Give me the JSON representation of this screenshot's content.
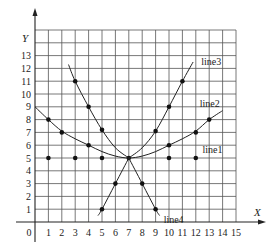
{
  "chart_data": {
    "type": "line",
    "title": "",
    "xlabel": "X",
    "ylabel": "Y",
    "xlim": [
      0,
      15
    ],
    "ylim": [
      0,
      15
    ],
    "grid": true,
    "x_ticks": [
      0,
      1,
      2,
      3,
      4,
      5,
      6,
      7,
      8,
      9,
      10,
      11,
      12,
      13,
      14,
      15
    ],
    "y_ticks": [
      1,
      2,
      3,
      4,
      5,
      6,
      7,
      8,
      9,
      10,
      11,
      12,
      13
    ],
    "origin_label": "0",
    "series": [
      {
        "name": "line1",
        "kind": "points",
        "points": [
          [
            1,
            5
          ],
          [
            3,
            5
          ],
          [
            5,
            5
          ],
          [
            7,
            5
          ],
          [
            10,
            5
          ],
          [
            12,
            5
          ]
        ],
        "label_at": [
          12.5,
          5.6
        ]
      },
      {
        "name": "line2",
        "kind": "curve",
        "curve": [
          [
            0,
            9
          ],
          [
            1,
            8
          ],
          [
            2,
            7.1
          ],
          [
            3,
            6.5
          ],
          [
            4,
            6
          ],
          [
            5,
            5.5
          ],
          [
            6,
            5.15
          ],
          [
            7,
            5
          ],
          [
            8,
            5.15
          ],
          [
            9,
            5.5
          ],
          [
            10,
            6
          ],
          [
            11,
            6.5
          ],
          [
            12,
            7.1
          ],
          [
            13,
            8
          ],
          [
            14,
            8.7
          ]
        ],
        "points": [
          [
            1,
            8
          ],
          [
            2,
            7
          ],
          [
            4,
            6
          ],
          [
            10,
            6
          ],
          [
            12,
            7
          ],
          [
            13,
            8
          ]
        ],
        "label_at": [
          12.3,
          9.2
        ]
      },
      {
        "name": "line3",
        "kind": "curve",
        "curve": [
          [
            2.5,
            12.3
          ],
          [
            3,
            11
          ],
          [
            4,
            9
          ],
          [
            5,
            7.2
          ],
          [
            6,
            5.8
          ],
          [
            7,
            5
          ],
          [
            8,
            5.8
          ],
          [
            9,
            7.1
          ],
          [
            10,
            9
          ],
          [
            11,
            11
          ],
          [
            11.8,
            12.5
          ]
        ],
        "points": [
          [
            3,
            11
          ],
          [
            4,
            9
          ],
          [
            5,
            7.2
          ],
          [
            9,
            7.1
          ],
          [
            10,
            9
          ],
          [
            11,
            11
          ]
        ],
        "label_at": [
          12.4,
          12.5
        ]
      },
      {
        "name": "line4",
        "kind": "curve",
        "curve": [
          [
            4.7,
            0.5
          ],
          [
            5,
            1
          ],
          [
            6,
            3
          ],
          [
            7,
            5
          ],
          [
            8,
            3
          ],
          [
            9,
            1
          ],
          [
            9.3,
            0.5
          ]
        ],
        "points": [
          [
            5,
            1
          ],
          [
            6,
            3
          ],
          [
            8,
            3
          ],
          [
            9,
            1
          ]
        ],
        "label_at": [
          9.6,
          0.15
        ]
      }
    ]
  }
}
